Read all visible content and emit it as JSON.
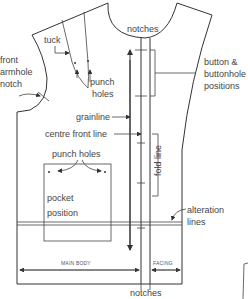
{
  "diagram": {
    "labels": {
      "tuck": "tuck",
      "front_armhole_notch": [
        "front",
        "armhole",
        "notch"
      ],
      "punch_holes_top": [
        "punch",
        "holes"
      ],
      "notches_top": "notches",
      "button_buttonhole": [
        "button &",
        "buttonhole",
        "positions"
      ],
      "grainline": "grainline",
      "centre_front_line": "centre front line",
      "fold_line": "fold line",
      "punch_holes_pocket": "punch holes",
      "pocket_position": [
        "pocket",
        "position"
      ],
      "alteration_lines": [
        "alteration",
        "lines"
      ],
      "main_body": "MAIN BODY",
      "facing": "FACING",
      "notches_bottom": "notches"
    },
    "colors": {
      "line": "#333333",
      "text": "#444444",
      "background": "#ffffff"
    }
  }
}
